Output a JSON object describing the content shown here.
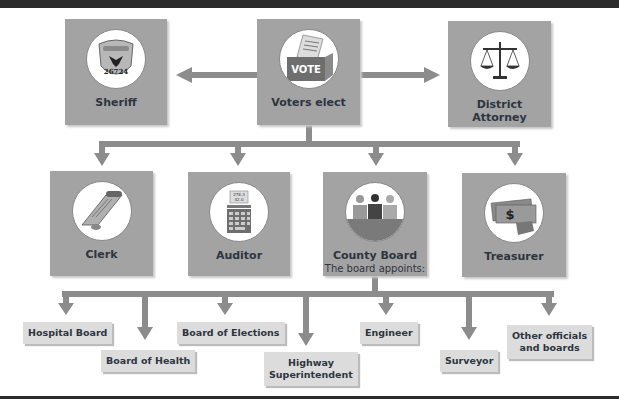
{
  "colors": {
    "box_fill": "#a3a3a3",
    "arrow": "#8c8c8c",
    "tag_fill": "#dcdcdc",
    "text": "#2d3540",
    "rule": "#2b2b2b"
  },
  "elected": {
    "center": {
      "label": "Voters elect",
      "icon": "ballot-box-icon",
      "icon_text": "VOTE"
    },
    "left": {
      "label": "Sheriff",
      "icon": "sheriff-badge-icon",
      "icon_text": "26724"
    },
    "right": {
      "label": "District Attorney",
      "line1": "District",
      "line2": "Attorney",
      "icon": "scales-of-justice-icon"
    }
  },
  "row2": [
    {
      "label": "Clerk",
      "icon": "scroll-document-icon"
    },
    {
      "label": "Auditor",
      "icon": "adding-machine-icon",
      "icon_text": [
        "278.3",
        "42.0"
      ]
    },
    {
      "label": "County Board",
      "sublabel": "The board appoints:",
      "icon": "board-members-icon"
    },
    {
      "label": "Treasurer",
      "icon": "money-hand-icon",
      "icon_text": "$"
    }
  ],
  "appointees": [
    {
      "label": "Hospital Board"
    },
    {
      "label": "Board of Health"
    },
    {
      "label": "Board of Elections"
    },
    {
      "label": "Highway Superintendent",
      "line1": "Highway",
      "line2": "Superintendent"
    },
    {
      "label": "Engineer"
    },
    {
      "label": "Surveyor"
    },
    {
      "label": "Other officials and boards",
      "line1": "Other officials",
      "line2": "and boards"
    }
  ]
}
